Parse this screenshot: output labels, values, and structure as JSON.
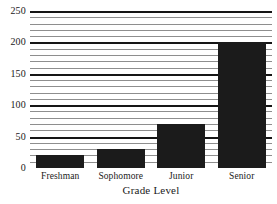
{
  "chart_data": {
    "type": "bar",
    "title": "",
    "xlabel": "Grade Level",
    "ylabel": "",
    "categories": [
      "Freshman",
      "Sophomore",
      "Junior",
      "Senior"
    ],
    "values": [
      20,
      30,
      70,
      200
    ],
    "ylim": [
      0,
      250
    ],
    "y_ticks": [
      0,
      50,
      100,
      150,
      200,
      250
    ],
    "y_tick_labels": [
      "0",
      "50",
      "100",
      "150",
      "200",
      "250"
    ],
    "minor_gridline_step": 10,
    "grid": "horizontal-lines-only",
    "legend": "none",
    "bar_color": "#1b1b1b",
    "major_gridline_color": "#161616",
    "minor_gridline_color": "#8e8e8e",
    "background_color": "#ffffff"
  },
  "axis": {
    "x_title": "Grade Level"
  }
}
